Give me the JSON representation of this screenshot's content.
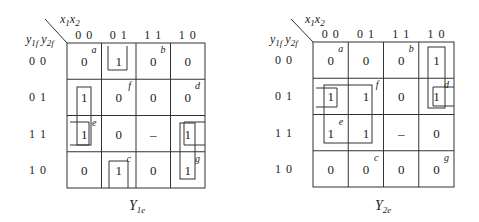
{
  "maps": [
    {
      "id": "Y1e",
      "title": "Y",
      "title_sub": "1e",
      "col_var": "x1x2",
      "col_var_parts": [
        "x",
        "1",
        "x",
        "2"
      ],
      "row_var_parts": [
        "y",
        "1f",
        " y",
        "2f"
      ],
      "col_headers": [
        "0 0",
        "0 1",
        "1 1",
        "1 0"
      ],
      "row_headers": [
        "0 0",
        "0 1",
        "1 1",
        "1 0"
      ],
      "cells": [
        [
          "0",
          "1",
          "0",
          "0"
        ],
        [
          "1",
          "0",
          "0",
          "0"
        ],
        [
          "1",
          "0",
          "–",
          "1"
        ],
        [
          "0",
          "1",
          "0",
          "1"
        ]
      ],
      "tags": [
        {
          "label": "a",
          "row": 0,
          "col": 0
        },
        {
          "label": "b",
          "row": 0,
          "col": 2
        },
        {
          "label": "f",
          "row": 1,
          "col": 1
        },
        {
          "label": "d",
          "row": 1,
          "col": 3
        },
        {
          "label": "e",
          "row": 2,
          "col": 0
        },
        {
          "label": "c",
          "row": 3,
          "col": 1
        },
        {
          "label": "g",
          "row": 3,
          "col": 3
        }
      ]
    },
    {
      "id": "Y2e",
      "title": "Y",
      "title_sub": "2e",
      "col_var": "x1x2",
      "col_var_parts": [
        "x",
        "1",
        "x",
        "2"
      ],
      "row_var_parts": [
        "y",
        "1f",
        " y",
        "2f"
      ],
      "col_headers": [
        "0 0",
        "0 1",
        "1 1",
        "1 0"
      ],
      "row_headers": [
        "0 0",
        "0 1",
        "1 1",
        "1 0"
      ],
      "cells": [
        [
          "0",
          "0",
          "0",
          "1"
        ],
        [
          "1",
          "1",
          "0",
          "1"
        ],
        [
          "1",
          "1",
          "–",
          "0"
        ],
        [
          "0",
          "0",
          "0",
          "0"
        ]
      ],
      "tags": [
        {
          "label": "a",
          "row": 0,
          "col": 0
        },
        {
          "label": "b",
          "row": 0,
          "col": 2
        },
        {
          "label": "f",
          "row": 1,
          "col": 1
        },
        {
          "label": "d",
          "row": 1,
          "col": 3
        },
        {
          "label": "e",
          "row": 2,
          "col": 0
        },
        {
          "label": "c",
          "row": 3,
          "col": 1
        },
        {
          "label": "g",
          "row": 3,
          "col": 3
        }
      ]
    }
  ]
}
